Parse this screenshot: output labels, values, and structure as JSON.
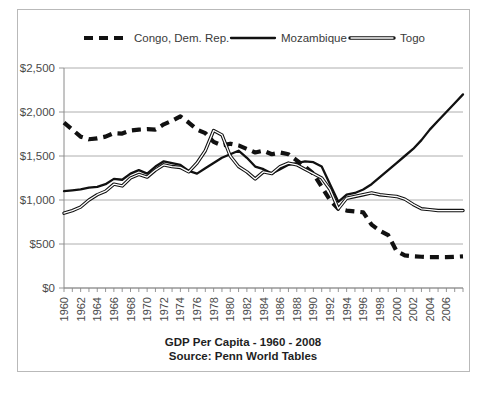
{
  "chart_data": {
    "type": "line",
    "title": "GDP Per Capita - 1960 - 2008",
    "subtitle": "Source: Penn World Tables",
    "xlabel": "",
    "ylabel": "",
    "ylim": [
      0,
      2500
    ],
    "ytick_values": [
      0,
      500,
      1000,
      1500,
      2000,
      2500
    ],
    "ytick_labels": [
      "$0",
      "$500",
      "$1,000",
      "$1,500",
      "$2,000",
      "$2,500"
    ],
    "grid": true,
    "legend_position": "top",
    "x": [
      1960,
      1961,
      1962,
      1963,
      1964,
      1965,
      1966,
      1967,
      1968,
      1969,
      1970,
      1971,
      1972,
      1973,
      1974,
      1975,
      1976,
      1977,
      1978,
      1979,
      1980,
      1981,
      1982,
      1983,
      1984,
      1985,
      1986,
      1987,
      1988,
      1989,
      1990,
      1991,
      1992,
      1993,
      1994,
      1995,
      1996,
      1997,
      1998,
      1999,
      2000,
      2001,
      2002,
      2003,
      2004,
      2005,
      2006,
      2007,
      2008
    ],
    "xtick_labels": [
      "1960",
      "1962",
      "1964",
      "1966",
      "1968",
      "1970",
      "1972",
      "1974",
      "1976",
      "1978",
      "1980",
      "1982",
      "1984",
      "1986",
      "1988",
      "1990",
      "1992",
      "1994",
      "1996",
      "1998",
      "2000",
      "2002",
      "2004",
      "2006"
    ],
    "series": [
      {
        "name": "Congo, Dem. Rep.",
        "style": "dashed",
        "values": [
          1880,
          1800,
          1720,
          1690,
          1700,
          1720,
          1760,
          1755,
          1790,
          1800,
          1805,
          1800,
          1860,
          1900,
          1950,
          1880,
          1800,
          1760,
          1660,
          1620,
          1640,
          1620,
          1580,
          1540,
          1560,
          1520,
          1540,
          1520,
          1450,
          1380,
          1300,
          1150,
          1000,
          900,
          880,
          870,
          860,
          720,
          650,
          600,
          420,
          370,
          360,
          355,
          350,
          350,
          350,
          355,
          360
        ]
      },
      {
        "name": "Mozambique",
        "style": "solid",
        "values": [
          1100,
          1110,
          1120,
          1140,
          1150,
          1180,
          1240,
          1230,
          1300,
          1340,
          1300,
          1380,
          1440,
          1420,
          1400,
          1330,
          1300,
          1360,
          1420,
          1480,
          1520,
          1560,
          1480,
          1380,
          1350,
          1300,
          1350,
          1400,
          1420,
          1440,
          1430,
          1380,
          1180,
          980,
          1060,
          1080,
          1120,
          1180,
          1260,
          1340,
          1420,
          1500,
          1580,
          1680,
          1800,
          1900,
          2000,
          2100,
          2200
        ]
      },
      {
        "name": "Togo",
        "style": "outlined",
        "values": [
          850,
          880,
          920,
          1000,
          1060,
          1100,
          1180,
          1160,
          1250,
          1290,
          1260,
          1340,
          1400,
          1380,
          1370,
          1320,
          1420,
          1560,
          1790,
          1740,
          1500,
          1380,
          1320,
          1240,
          1320,
          1300,
          1380,
          1420,
          1400,
          1350,
          1300,
          1250,
          1120,
          900,
          1020,
          1040,
          1060,
          1080,
          1060,
          1050,
          1040,
          1010,
          950,
          900,
          890,
          880,
          880,
          880,
          880
        ]
      }
    ]
  },
  "legend": {
    "items": [
      {
        "label": "Congo, Dem. Rep."
      },
      {
        "label": "Mozambique"
      },
      {
        "label": "Togo"
      }
    ]
  }
}
